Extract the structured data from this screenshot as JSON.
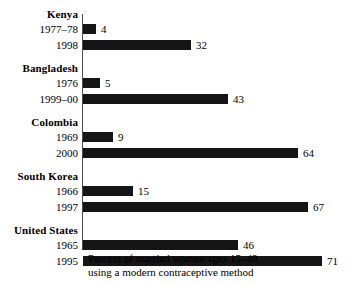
{
  "chart_data": {
    "type": "bar",
    "orientation": "horizontal",
    "title": "",
    "xlabel": "Percent of married women ages 15–49 using a modern contraceptive method",
    "ylabel": "",
    "xlim": [
      0,
      75
    ],
    "grid": false,
    "legend": "none",
    "categories": [
      "Kenya 1977–78",
      "Kenya 1998",
      "Bangladesh 1976",
      "Bangladesh 1999–00",
      "Colombia 1969",
      "Colombia 2000",
      "South Korea 1966",
      "South Korea 1997",
      "United States 1965",
      "United States 1995"
    ],
    "values": [
      4,
      32,
      5,
      43,
      9,
      64,
      15,
      67,
      46,
      71
    ],
    "groups": [
      {
        "name": "Kenya",
        "rows": [
          {
            "label": "1977–78",
            "value": 4,
            "value_text": "4"
          },
          {
            "label": "1998",
            "value": 32,
            "value_text": "32"
          }
        ]
      },
      {
        "name": "Bangladesh",
        "rows": [
          {
            "label": "1976",
            "value": 5,
            "value_text": "5"
          },
          {
            "label": "1999–00",
            "value": 43,
            "value_text": "43"
          }
        ]
      },
      {
        "name": "Colombia",
        "rows": [
          {
            "label": "1969",
            "value": 9,
            "value_text": "9"
          },
          {
            "label": "2000",
            "value": 64,
            "value_text": "64"
          }
        ]
      },
      {
        "name": "South Korea",
        "rows": [
          {
            "label": "1966",
            "value": 15,
            "value_text": "15"
          },
          {
            "label": "1997",
            "value": 67,
            "value_text": "67"
          }
        ]
      },
      {
        "name": "United States",
        "rows": [
          {
            "label": "1965",
            "value": 46,
            "value_text": "46"
          },
          {
            "label": "1995",
            "value": 71,
            "value_text": "71"
          }
        ]
      }
    ],
    "caption_line1": "Percent of married women ages 15–49",
    "caption_line2": "using a modern contraceptive method",
    "colors": {
      "bar": "#151515",
      "axis": "#4a4a4a",
      "text": "#000000",
      "background": "#ffffff"
    }
  }
}
